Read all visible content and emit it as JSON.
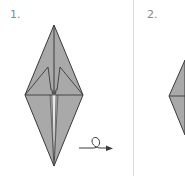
{
  "steps": [
    {
      "label": "1.",
      "description": "Origami crane base, front view with folded wings"
    },
    {
      "label": "2.",
      "description": "Origami diamond (partially visible)"
    }
  ],
  "symbols": {
    "turn_over_arrow": "turn-over-arrow-icon"
  },
  "colors": {
    "paper_fill": "#a9a9a9",
    "outline": "#3a3a3a",
    "highlight": "#e8e8e8",
    "label": "#8a8a8a",
    "divider": "#d8d8d8",
    "background": "#ffffff"
  }
}
